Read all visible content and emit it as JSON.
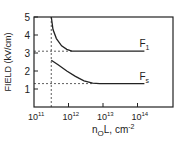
{
  "chart_data": {
    "type": "line",
    "title": "",
    "xlabel": "n₀L, cm⁻²",
    "xlabel_main": "n",
    "xlabel_sub": "O",
    "xlabel_rest": "L, cm",
    "xlabel_sup": "-2",
    "ylabel": "FIELD (kV/cm)",
    "xscale": "log",
    "xlim_log10": [
      11,
      14.8
    ],
    "ylim": [
      0,
      5
    ],
    "xticks": [
      {
        "base": "10",
        "exp": "11",
        "log10": 11
      },
      {
        "base": "10",
        "exp": "12",
        "log10": 12
      },
      {
        "base": "10",
        "exp": "13",
        "log10": 13
      },
      {
        "base": "10",
        "exp": "14",
        "log10": 14
      }
    ],
    "yticks": [
      "1",
      "2",
      "3",
      "4",
      "5"
    ],
    "ytick_values": [
      1,
      2,
      3,
      4,
      5
    ],
    "reference_lines": {
      "vertical_x_log10": 11.5,
      "horizontal_y": [
        3.1,
        1.3
      ]
    },
    "series": [
      {
        "name": "F1",
        "label_main": "F",
        "label_sub": "1",
        "points_log10x": [
          [
            11.5,
            5.0
          ],
          [
            11.55,
            4.3
          ],
          [
            11.65,
            3.8
          ],
          [
            11.8,
            3.4
          ],
          [
            11.95,
            3.2
          ],
          [
            12.1,
            3.1
          ],
          [
            14.2,
            3.1
          ]
        ]
      },
      {
        "name": "Fs",
        "label_main": "F",
        "label_sub": "s",
        "points_log10x": [
          [
            11.5,
            2.6
          ],
          [
            11.7,
            2.35
          ],
          [
            11.95,
            2.0
          ],
          [
            12.2,
            1.7
          ],
          [
            12.45,
            1.45
          ],
          [
            12.7,
            1.32
          ],
          [
            12.9,
            1.3
          ],
          [
            14.2,
            1.3
          ]
        ]
      }
    ]
  }
}
